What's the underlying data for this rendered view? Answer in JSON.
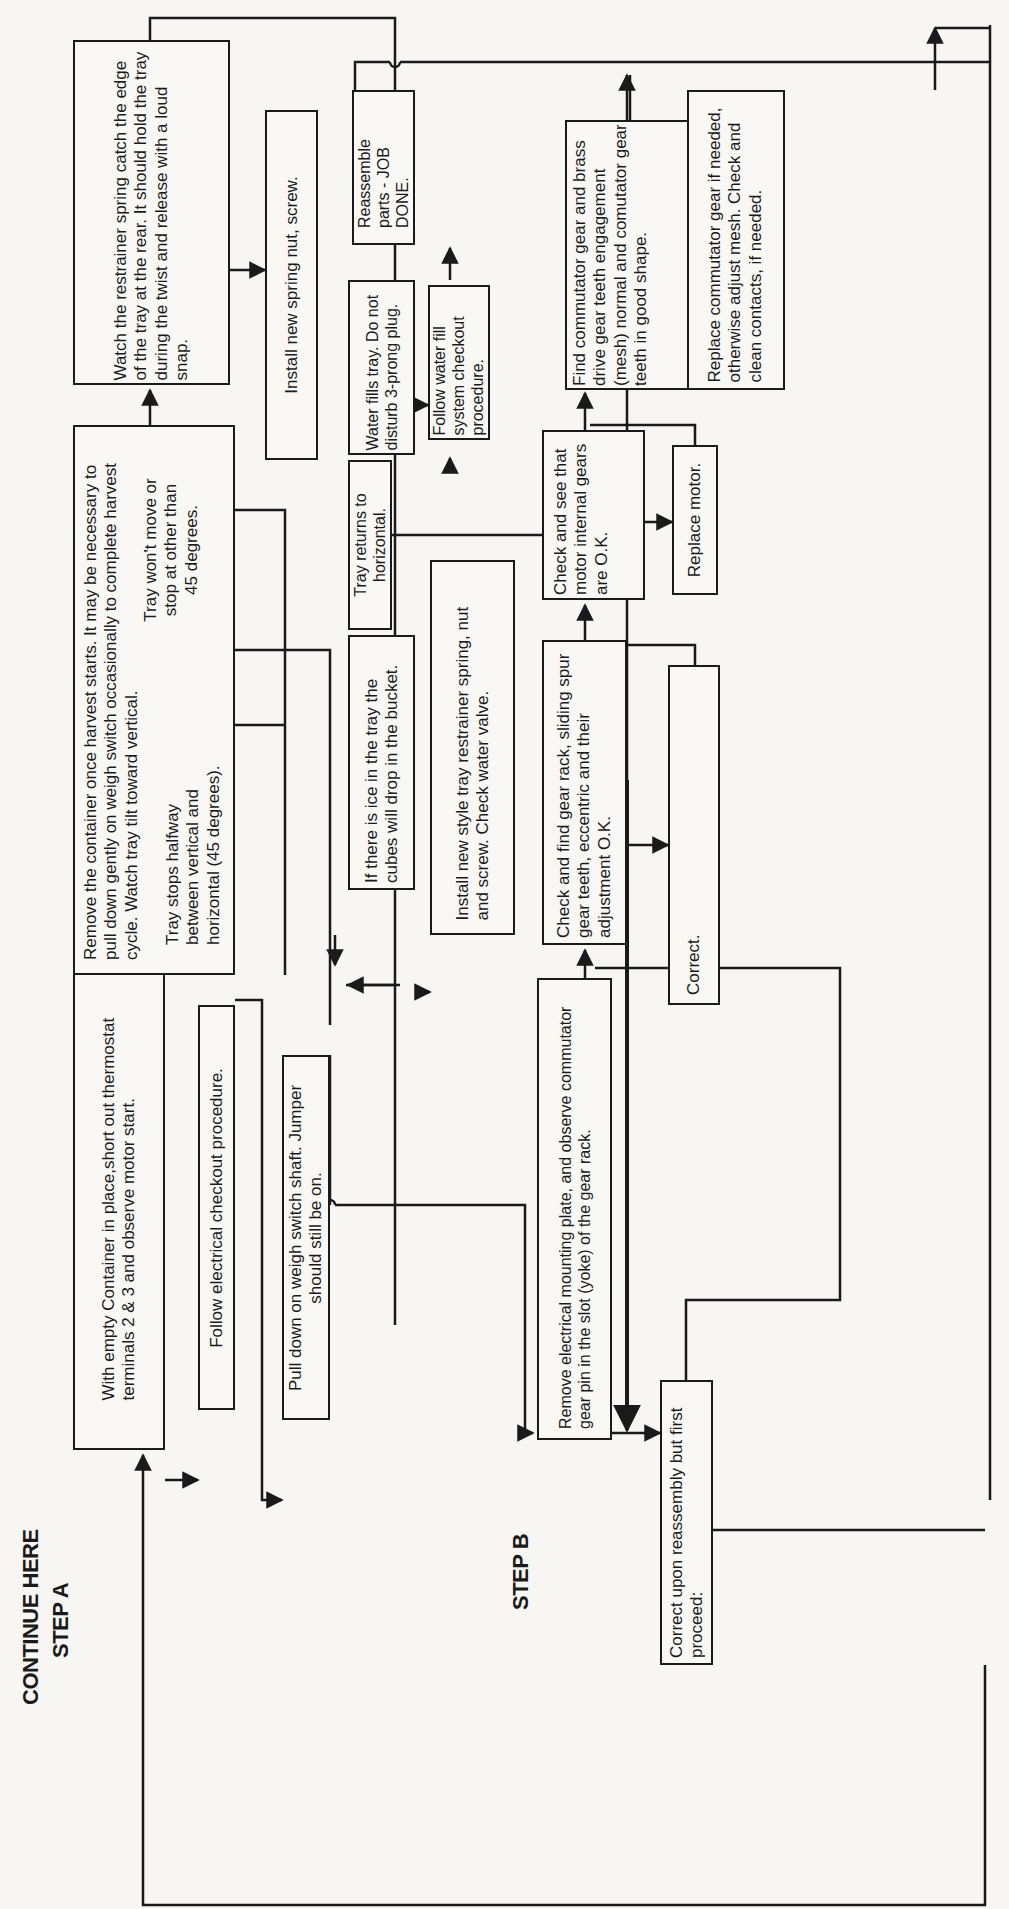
{
  "labels": {
    "continue_here": "CONTINUE HERE",
    "step_a": "STEP A",
    "step_b": "STEP B"
  },
  "boxes": {
    "step_a_start": "With empty Container in place,short out thermostat terminals 2 & 3 and observe motor start.",
    "follow_electrical": "Follow electrical checkout procedure.",
    "remove_container": "Remove the container once harvest starts. It may be necessary to pull down gently on weigh switch occasionally to complete harvest cycle. Watch tray tilt toward vertical.",
    "tray_stops_halfway": "Tray stops halfway between vertical and horizontal (45 degrees).",
    "tray_wont_move": "Tray won't move or stop at other than 45 degrees.",
    "watch_restrainer": "Watch the restrainer spring catch the edge of the tray at the rear. It should hold the tray during the twist and release with a loud snap.",
    "pull_down_weigh": "Pull down on weigh  switch shaft. Jumper should still be on.",
    "install_spring_nut": "Install new spring nut, screw.",
    "ice_in_tray": "If there is ice in the tray the cubes will drop in the bucket.",
    "tray_returns": "Tray returns to horizontal.",
    "water_fills": "Water fills tray. Do not disturb 3-prong plug.",
    "reassemble": "Reassemble parts - JOB DONE.",
    "follow_water_fill": "Follow water fill system checkout procedure.",
    "install_new_style": "Install new style tray restrainer spring, nut and screw. Check water valve.",
    "step_b_remove_plate": "Remove electrical mounting plate, and observe commutator gear pin in the slot (yoke) of the gear rack.",
    "check_gear_rack": "Check and find gear rack, sliding spur gear teeth, eccentric and their adjustment O.K.",
    "correct": "Correct.",
    "check_motor_gears": "Check and see that motor internal gears are O.K.",
    "replace_motor": "Replace motor.",
    "find_commutator": "Find commutator gear and brass drive gear teeth engagement (mesh) normal and comutator gear teeth in good shape.",
    "replace_commutator": "Replace commutator gear if needed, otherwise adjust mesh. Check and clean contacts, if needed.",
    "correct_upon_reassembly": "Correct upon reassembly but first proceed:"
  },
  "colors": {
    "ink": "#1a1a1a",
    "paper": "#f7f6f3"
  }
}
